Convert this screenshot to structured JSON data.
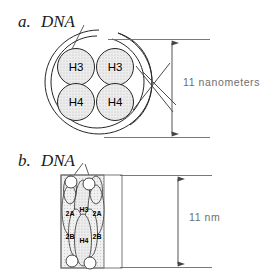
{
  "figure": {
    "background_color": "#ffffff"
  },
  "panels": [
    {
      "id": "a",
      "label": "a.",
      "molecule_label": "DNA",
      "view": "top-view",
      "core_labels": [
        "H3",
        "H3",
        "H4",
        "H4"
      ],
      "dimension": {
        "value": "11",
        "unit": "nanometers",
        "text": "11 nanometers"
      }
    },
    {
      "id": "b",
      "label": "b.",
      "molecule_label": "DNA",
      "view": "side-view",
      "core_labels": [
        "2A",
        "H3",
        "2A",
        "2B",
        "H4",
        "2B"
      ],
      "dimension": {
        "value": "11",
        "unit": "nm",
        "text": "11 nm"
      }
    }
  ],
  "colors": {
    "outline": "#262626",
    "fill_light": "#ececec",
    "fill_hatch": "#dcdcdc",
    "dimension": "#555555",
    "dimension_text": "#6e6e6e",
    "label_text": "#1a1a1a"
  }
}
